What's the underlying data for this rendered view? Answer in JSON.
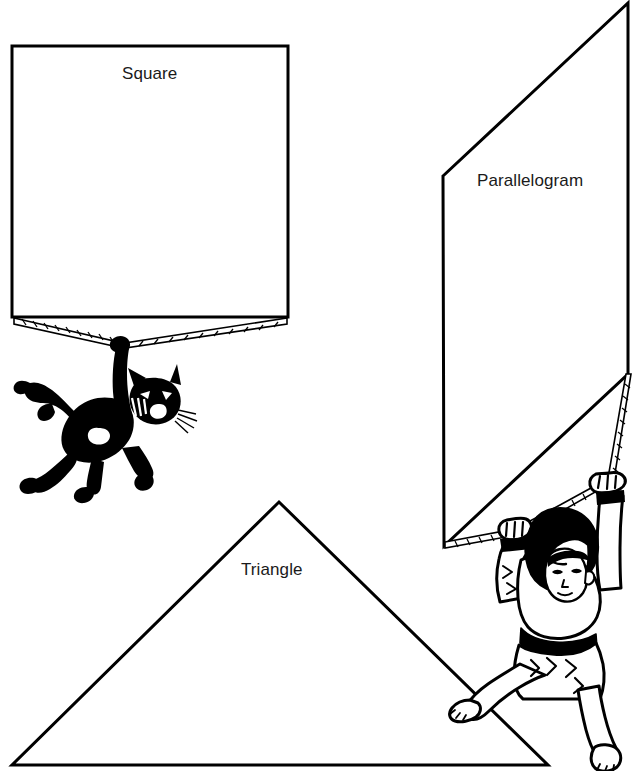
{
  "illustration": {
    "title": "Geometric shape kites line drawing",
    "background_color": "#ffffff",
    "ink_color": "#000000",
    "width": 641,
    "height": 771
  },
  "labels": {
    "square": "Square",
    "parallelogram": "Parallelogram",
    "triangle": "Triangle"
  },
  "shapes": [
    {
      "name": "square",
      "label": "Square",
      "type": "square",
      "points": "12,46 288,46 288,317 12,317",
      "stroke_color": "#000000",
      "stroke_width": 3
    },
    {
      "name": "parallelogram",
      "label": "Parallelogram",
      "type": "parallelogram",
      "points": "443,176 628,3 628,374 444,546",
      "stroke_color": "#000000",
      "stroke_width": 3
    },
    {
      "name": "triangle",
      "label": "Triangle",
      "type": "triangle",
      "points": "279,502 548,765 12,765",
      "stroke_color": "#000000",
      "stroke_width": 3
    }
  ],
  "figures": [
    {
      "name": "cat",
      "description": "black silhouette cat hanging from the square kite rope",
      "attached_to": "square"
    },
    {
      "name": "boy",
      "description": "boy with black hair gripping the parallelogram kite rope with both hands",
      "attached_to": "parallelogram"
    }
  ],
  "ropes": [
    {
      "name": "square-rope-left",
      "from": "square bottom-left corner",
      "to": "knot"
    },
    {
      "name": "square-rope-right",
      "from": "square bottom-right corner",
      "to": "knot"
    },
    {
      "name": "parallelogram-rope",
      "from": "parallelogram bottom-left corner",
      "to": "boy left hand"
    },
    {
      "name": "parallelogram-rope-upper",
      "from": "parallelogram bottom-right corner",
      "to": "boy right hand"
    }
  ]
}
